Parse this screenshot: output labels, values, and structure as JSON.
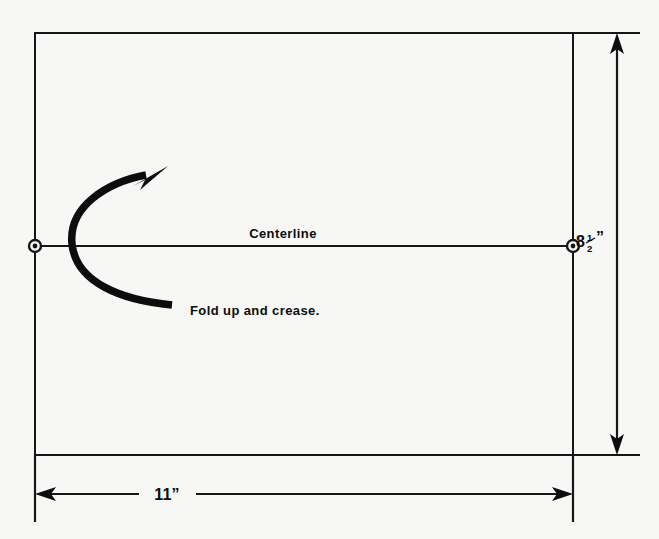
{
  "diagram": {
    "sheet": {
      "name": "paper-sheet",
      "width_label": "11”",
      "height_label_whole": "8",
      "height_label_fraction_numerator": "1",
      "height_label_fraction_denominator": "2",
      "height_label_unit": "”",
      "height_label_full": "8½”"
    },
    "centerline": {
      "name": "centerline",
      "label": "Centerline"
    },
    "fold_instruction": {
      "name": "fold-instruction",
      "label": "Fold up and crease."
    },
    "dimensions": [
      {
        "name": "height-dimension",
        "value": "8½”",
        "orientation": "vertical"
      },
      {
        "name": "width-dimension",
        "value": "11”",
        "orientation": "horizontal"
      }
    ],
    "colors": {
      "ink": "#0d0d0d",
      "line": "#161616",
      "paper": "#f7f7f5"
    },
    "markers": [
      {
        "name": "centerline-endpoint-left"
      },
      {
        "name": "centerline-endpoint-right"
      }
    ]
  }
}
